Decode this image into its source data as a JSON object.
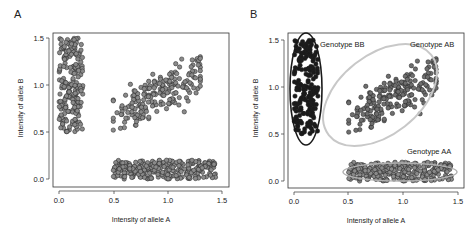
{
  "chart_data": [
    {
      "panel": "A",
      "type": "scatter",
      "title": "",
      "xlabel": "Intensity of allele A",
      "ylabel": "Intensity of allele B",
      "xlim": [
        0.0,
        1.5
      ],
      "ylim": [
        0.0,
        1.5
      ],
      "xticks": [
        "0.0",
        "0.5",
        "1.0",
        "1.5"
      ],
      "yticks": [
        "0.0",
        "0.5",
        "1.0",
        "1.5"
      ],
      "grid": false,
      "marker_color": "#8a8a8a",
      "clusters": [
        {
          "name": "cluster-BB",
          "x_range": [
            0.0,
            0.22
          ],
          "y_range": [
            0.5,
            1.5
          ],
          "n": 200
        },
        {
          "name": "cluster-AB",
          "x_range": [
            0.5,
            1.3
          ],
          "y_range": [
            0.5,
            1.3
          ],
          "n": 200
        },
        {
          "name": "cluster-AA",
          "x_range": [
            0.5,
            1.45
          ],
          "y_range": [
            0.0,
            0.2
          ],
          "n": 260
        }
      ]
    },
    {
      "panel": "B",
      "type": "scatter",
      "title": "",
      "xlabel": "Intensity of allele A",
      "ylabel": "Intensity of allele B",
      "xlim": [
        0.0,
        1.5
      ],
      "ylim": [
        0.0,
        1.5
      ],
      "xticks": [
        "0.0",
        "0.5",
        "1.0",
        "1.5"
      ],
      "yticks": [
        "0.0",
        "0.5",
        "1.0",
        "1.5"
      ],
      "grid": false,
      "clusters": [
        {
          "name": "Genotype BB",
          "x_range": [
            0.0,
            0.22
          ],
          "y_range": [
            0.5,
            1.5
          ],
          "n": 200,
          "marker_color": "#1a1a1a",
          "ellipse_color": "#1a1a1a"
        },
        {
          "name": "Genotype AB",
          "x_range": [
            0.5,
            1.3
          ],
          "y_range": [
            0.5,
            1.3
          ],
          "n": 200,
          "marker_color": "#6e6e6e",
          "ellipse_color": "#c8c8c8"
        },
        {
          "name": "Genotype AA",
          "x_range": [
            0.5,
            1.45
          ],
          "y_range": [
            0.0,
            0.2
          ],
          "n": 260,
          "marker_color": "#8a8a8a",
          "ellipse_color": "#b0b0b0"
        }
      ],
      "annotations": [
        "Genotype BB",
        "Genotype AB",
        "Genotype AA"
      ]
    }
  ],
  "panels": {
    "a": {
      "label": "A"
    },
    "b": {
      "label": "B"
    }
  },
  "axes": {
    "xlabel": "Intensity of allele A",
    "ylabel": "Intensity of allele B",
    "ticks": [
      "0.0",
      "0.5",
      "1.0",
      "1.5"
    ]
  },
  "annotations": {
    "bb": "Genotype BB",
    "ab": "Genotype AB",
    "aa": "Genotype AA"
  }
}
